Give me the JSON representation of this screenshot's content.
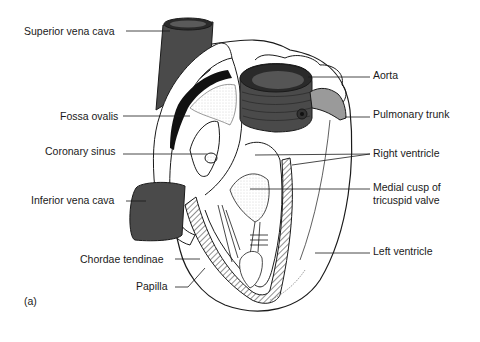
{
  "figure": {
    "panel_label": "(a)",
    "labels_left": [
      {
        "id": "superior-vena-cava",
        "text": "Superior vena cava"
      },
      {
        "id": "fossa-ovalis",
        "text": "Fossa ovalis"
      },
      {
        "id": "coronary-sinus",
        "text": "Coronary sinus"
      },
      {
        "id": "inferior-vena-cava",
        "text": "Inferior vena cava"
      },
      {
        "id": "chordae-tendinae",
        "text": "Chordae tendinae"
      },
      {
        "id": "papilla",
        "text": "Papilla"
      }
    ],
    "labels_right": [
      {
        "id": "aorta",
        "text": "Aorta"
      },
      {
        "id": "pulmonary-trunk",
        "text": "Pulmonary trunk"
      },
      {
        "id": "right-ventricle",
        "text": "Right ventricle"
      },
      {
        "id": "medial-cusp",
        "text": "Medial cusp of",
        "text2": "tricuspid valve"
      },
      {
        "id": "left-ventricle",
        "text": "Left ventricle"
      }
    ],
    "colors": {
      "vessel_dark": "#4a4a4a",
      "vessel_mid": "#7a7a7a",
      "pulmonary": "#9a9a9a",
      "outline": "#1a1a1a",
      "background": "#ffffff"
    }
  }
}
